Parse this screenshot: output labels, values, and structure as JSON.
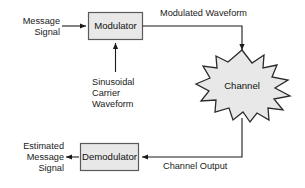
{
  "diagram": {
    "colors": {
      "block_fill": "#e8e8e8",
      "block_stroke": "#5a5a5a",
      "star_fill": "#e8e8e8",
      "star_stroke": "#2b2b2b",
      "line": "#1a1a1a",
      "text": "#1a1a1a",
      "background": "#ffffff"
    },
    "blocks": [
      {
        "id": "modulator",
        "label": "Modulator",
        "shape": "rectangle"
      },
      {
        "id": "demodulator",
        "label": "Demodulator",
        "shape": "rectangle"
      },
      {
        "id": "channel",
        "label": "Channel",
        "shape": "starburst"
      }
    ],
    "labels": {
      "message_signal": "Message\nSignal",
      "carrier": "Sinusoidal\nCarrier\nWaveform",
      "modulated_waveform": "Modulated Waveform",
      "channel_output": "Channel Output",
      "estimated_message_signal": "Estimated\nMessage\nSignal"
    },
    "connections": [
      {
        "id": "message-to-modulator",
        "from": "Message Signal",
        "to": "Modulator",
        "arrow": true
      },
      {
        "id": "carrier-to-modulator",
        "from": "Sinusoidal Carrier Waveform",
        "to": "Modulator",
        "arrow": true
      },
      {
        "id": "modulator-to-channel",
        "from": "Modulator",
        "to": "Channel",
        "label": "Modulated Waveform",
        "arrow": true
      },
      {
        "id": "channel-to-demodulator",
        "from": "Channel",
        "to": "Demodulator",
        "label": "Channel Output",
        "arrow": true
      },
      {
        "id": "demodulator-to-output",
        "from": "Demodulator",
        "to": "Estimated Message Signal",
        "arrow": true
      }
    ]
  }
}
